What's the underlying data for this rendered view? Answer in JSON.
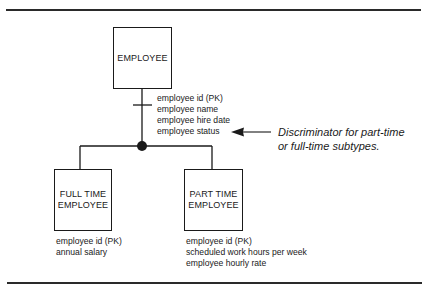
{
  "diagram": {
    "type": "entity-relationship supertype/subtype",
    "supertype": {
      "name": "EMPLOYEE",
      "attributes": [
        "employee id (PK)",
        "employee name",
        "employee hire date",
        "employee status"
      ]
    },
    "subtypes": [
      {
        "name_line1": "FULL TIME",
        "name_line2": "EMPLOYEE",
        "attributes": [
          "employee id (PK)",
          "annual salary"
        ]
      },
      {
        "name_line1": "PART TIME",
        "name_line2": "EMPLOYEE",
        "attributes": [
          "employee id (PK)",
          "scheduled work hours per week",
          "employee hourly rate"
        ]
      }
    ],
    "annotation": {
      "line1": "Discriminator for part-time",
      "line2": "or full-time subtypes.",
      "points_to": "employee status"
    },
    "colors": {
      "ink": "#1a1a1a",
      "background": "#ffffff"
    }
  }
}
